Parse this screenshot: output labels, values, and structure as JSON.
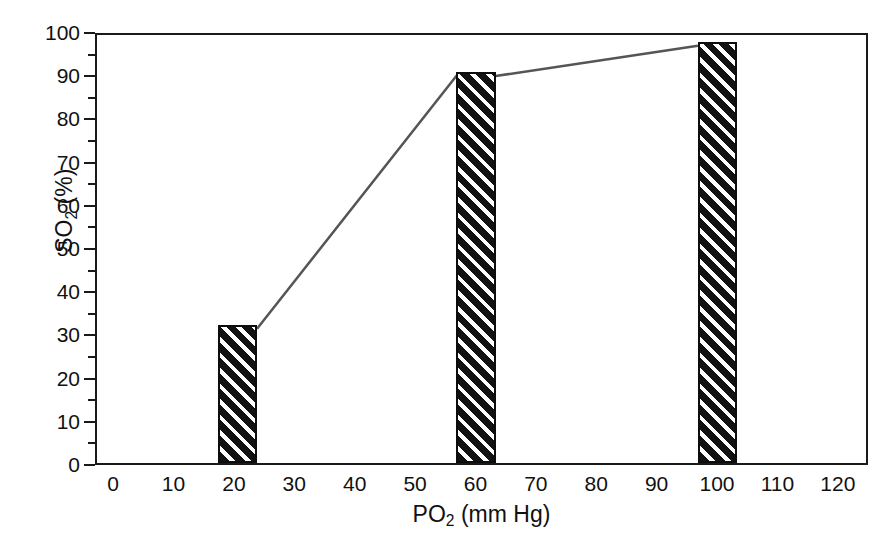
{
  "chart_data": {
    "type": "bar",
    "title": "",
    "subtitle": "",
    "xlabel": "PO2 (mm Hg)",
    "xlabel_base": "PO",
    "xlabel_sub": "2",
    "xlabel_rest": " (mm Hg)",
    "ylabel": "SO2 (%)",
    "ylabel_base": "SO",
    "ylabel_sub": "2",
    "ylabel_rest": " (%)",
    "xlim": [
      -3,
      125
    ],
    "ylim": [
      0,
      100
    ],
    "x_tick_labels": [
      "0",
      "10",
      "20",
      "30",
      "40",
      "50",
      "60",
      "70",
      "80",
      "90",
      "100",
      "110",
      "120"
    ],
    "x_tick_values": [
      0,
      10,
      20,
      30,
      40,
      50,
      60,
      70,
      80,
      90,
      100,
      110,
      120
    ],
    "y_tick_labels": [
      "0",
      "10",
      "20",
      "30",
      "40",
      "50",
      "60",
      "70",
      "80",
      "90",
      "100"
    ],
    "y_tick_values": [
      0,
      10,
      20,
      30,
      40,
      50,
      60,
      70,
      80,
      90,
      100
    ],
    "y_minor_tick_values": [
      5,
      15,
      25,
      35,
      45,
      55,
      65,
      75,
      85,
      95
    ],
    "grid": false,
    "legend": "none",
    "bar_style": "diagonal-hatch-black",
    "bar_fill_color": "#121212",
    "bar_hatch_color": "#ffffff",
    "line_color": "#555555",
    "axis_color": "#1a1a1a",
    "background_color": "#ffffff",
    "categories": [
      20,
      60,
      100
    ],
    "values": [
      32,
      90.5,
      97.5
    ],
    "bars": [
      {
        "label": "20",
        "x": 20,
        "y": 32,
        "x_left": 17,
        "x_right": 23.5
      },
      {
        "label": "60",
        "x": 60,
        "y": 90.5,
        "x_left": 56.5,
        "x_right": 63
      },
      {
        "label": "100",
        "x": 100,
        "y": 97.5,
        "x_left": 96.5,
        "x_right": 103
      }
    ],
    "line_points": [
      {
        "x": 23.5,
        "y": 32
      },
      {
        "x": 56.5,
        "y": 90.5
      },
      {
        "x": 63,
        "y": 90.5
      },
      {
        "x": 96.5,
        "y": 97.5
      }
    ]
  }
}
